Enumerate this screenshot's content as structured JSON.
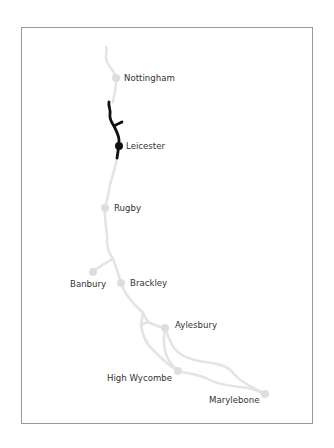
{
  "map": {
    "title": "Route map",
    "colors": {
      "line": "#e4e4e4",
      "station": "#dedede",
      "highlight": "#111111",
      "label": "#333333",
      "frame": "#9a9a9a"
    },
    "stations": [
      {
        "id": "nottingham",
        "name": "Nottingham",
        "highlighted": false
      },
      {
        "id": "leicester",
        "name": "Leicester",
        "highlighted": true
      },
      {
        "id": "rugby",
        "name": "Rugby",
        "highlighted": false
      },
      {
        "id": "banbury",
        "name": "Banbury",
        "highlighted": false
      },
      {
        "id": "brackley",
        "name": "Brackley",
        "highlighted": false
      },
      {
        "id": "aylesbury",
        "name": "Aylesbury",
        "highlighted": false
      },
      {
        "id": "high-wycombe",
        "name": "High Wycombe",
        "highlighted": false
      },
      {
        "id": "marylebone",
        "name": "Marylebone",
        "highlighted": false
      }
    ],
    "highlighted_section": "Leicester"
  }
}
